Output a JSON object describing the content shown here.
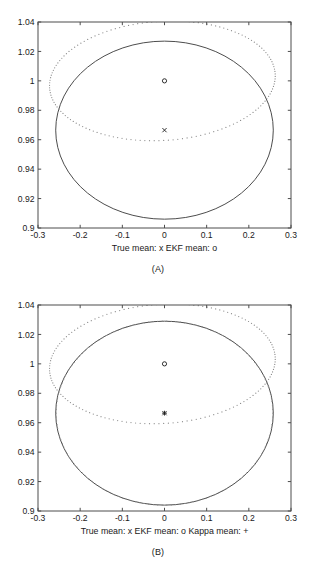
{
  "figure": {
    "panels": [
      {
        "id": "A",
        "caption": "(A)",
        "xlabel": "True mean: x     EKF mean: o",
        "legend_parts": [
          "True mean: x",
          "EKF mean: o"
        ]
      },
      {
        "id": "B",
        "caption": "(B)",
        "xlabel": "True mean: x     EKF mean: o     Kappa mean: +",
        "legend_parts": [
          "True mean: x",
          "EKF mean: o",
          "Kappa mean: +"
        ]
      }
    ]
  },
  "chart_data": [
    {
      "type": "scatter",
      "title": "",
      "subtitle": "",
      "panel": "(A)",
      "xlabel": "True mean: x     EKF mean: o",
      "ylabel": "",
      "xlim": [
        -0.3,
        0.3
      ],
      "ylim": [
        0.9,
        1.04
      ],
      "xticks": [
        -0.3,
        -0.2,
        -0.1,
        0,
        0.1,
        0.2,
        0.3
      ],
      "xticklabels": [
        "-0.3",
        "-0.2",
        "-0.1",
        "0",
        "0.1",
        "0.2",
        "0.3"
      ],
      "yticks": [
        0.9,
        0.92,
        0.94,
        0.96,
        0.98,
        1,
        1.02,
        1.04
      ],
      "yticklabels": [
        "0.9",
        "0.92",
        "0.94",
        "0.96",
        "0.98",
        "1",
        "1.02",
        "1.04"
      ],
      "grid": false,
      "legend_position": "below-axis",
      "markers": [
        {
          "name": "EKF mean",
          "symbol": "o",
          "x": 0.0,
          "y": 1.0
        },
        {
          "name": "True mean",
          "symbol": "x",
          "x": 0.0,
          "y": 0.9665
        }
      ],
      "ellipses": [
        {
          "name": "EKF covariance ellipse",
          "style": "solid",
          "center_x": 0.0,
          "center_y": 0.9665,
          "semi_axis_x": 0.258,
          "semi_axis_y": 0.0605,
          "rotation_deg": 0
        },
        {
          "name": "true covariance ellipse",
          "style": "dotted",
          "center_x": -0.005,
          "center_y": 1.0,
          "semi_axis_x": 0.268,
          "semi_axis_y": 0.0405,
          "rotation_deg": -3.5
        }
      ]
    },
    {
      "type": "scatter",
      "title": "",
      "subtitle": "",
      "panel": "(B)",
      "xlabel": "True mean: x     EKF mean: o     Kappa mean: +",
      "ylabel": "",
      "xlim": [
        -0.3,
        0.3
      ],
      "ylim": [
        0.9,
        1.04
      ],
      "xticks": [
        -0.3,
        -0.2,
        -0.1,
        0,
        0.1,
        0.2,
        0.3
      ],
      "xticklabels": [
        "-0.3",
        "-0.2",
        "-0.1",
        "0",
        "0.1",
        "0.2",
        "0.3"
      ],
      "yticks": [
        0.9,
        0.92,
        0.94,
        0.96,
        0.98,
        1,
        1.02,
        1.04
      ],
      "yticklabels": [
        "0.9",
        "0.92",
        "0.94",
        "0.96",
        "0.98",
        "1",
        "1.02",
        "1.04"
      ],
      "grid": false,
      "legend_position": "below-axis",
      "markers": [
        {
          "name": "EKF mean",
          "symbol": "o",
          "x": 0.0,
          "y": 1.0
        },
        {
          "name": "True mean",
          "symbol": "x",
          "x": 0.0,
          "y": 0.9665
        },
        {
          "name": "Kappa mean",
          "symbol": "+",
          "x": 0.0,
          "y": 0.9665
        }
      ],
      "ellipses": [
        {
          "name": "EKF covariance ellipse",
          "style": "solid",
          "center_x": 0.0,
          "center_y": 0.9665,
          "semi_axis_x": 0.258,
          "semi_axis_y": 0.0625,
          "rotation_deg": 0
        },
        {
          "name": "Kappa covariance ellipse",
          "style": "dotted",
          "center_x": 0.0,
          "center_y": 0.9665,
          "semi_axis_x": 0.257,
          "semi_axis_y": 0.0625,
          "rotation_deg": 0
        },
        {
          "name": "true covariance ellipse",
          "style": "dotted",
          "center_x": -0.005,
          "center_y": 1.0,
          "semi_axis_x": 0.268,
          "semi_axis_y": 0.0405,
          "rotation_deg": -3.5
        }
      ]
    }
  ]
}
